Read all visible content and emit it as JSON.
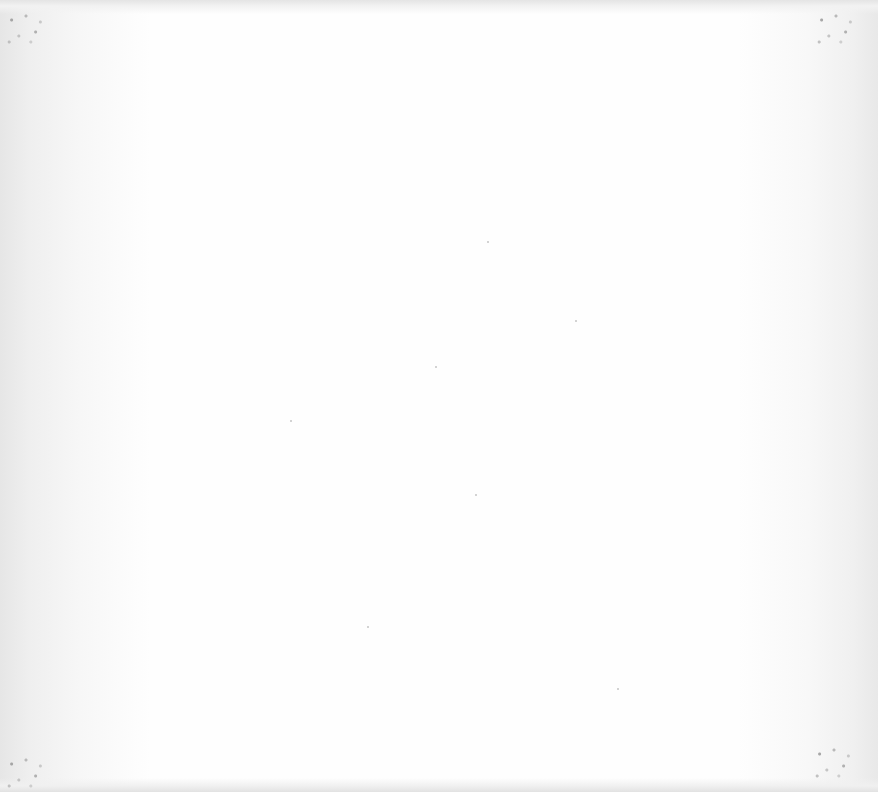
{
  "document": {
    "page_state": "blank",
    "text_content": "",
    "background_color": "#fefefe",
    "edge_shade_color": "#e6e6e6"
  }
}
